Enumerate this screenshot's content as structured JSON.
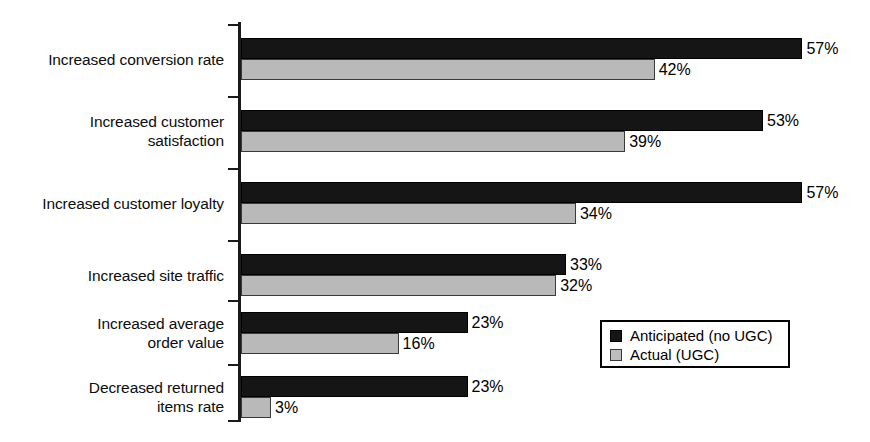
{
  "chart_data": {
    "type": "bar",
    "orientation": "horizontal",
    "title": "",
    "xlabel": "",
    "ylabel": "",
    "xlim": [
      0,
      62
    ],
    "grid": false,
    "value_suffix": "%",
    "legend_position": "lower-right",
    "categories": [
      "Increased conversion rate",
      "Increased customer\nsatisfaction",
      "Increased customer loyalty",
      "Increased site traffic",
      "Increased average\norder value",
      "Decreased returned\nitems rate"
    ],
    "series": [
      {
        "name": "Anticipated (no UGC)",
        "color": "#151515",
        "values": [
          57,
          53,
          57,
          33,
          23,
          23
        ],
        "labels": [
          "57%",
          "53%",
          "57%",
          "33%",
          "23%",
          "23%"
        ]
      },
      {
        "name": "Actual (UGC)",
        "color": "#b9b9b9",
        "values": [
          42,
          39,
          34,
          32,
          16,
          3
        ],
        "labels": [
          "42%",
          "39%",
          "34%",
          "32%",
          "16%",
          "3%"
        ]
      }
    ]
  },
  "legend": {
    "items": [
      {
        "label": "Anticipated (no UGC)",
        "swatch": "black-square-swatch"
      },
      {
        "label": "Actual (UGC)",
        "swatch": "gray-square-swatch"
      }
    ]
  },
  "axis": {
    "ticks": 7
  }
}
